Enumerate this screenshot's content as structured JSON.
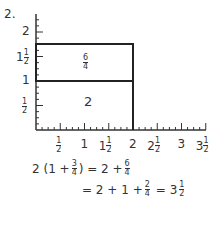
{
  "problem_number": "2.",
  "chart_data": {
    "type": "area",
    "title": "",
    "xlabel": "",
    "ylabel": "",
    "xlim": [
      0,
      3.5
    ],
    "ylim": [
      0,
      2
    ],
    "x_ticks": [
      "1/2",
      "1",
      "1 1/2",
      "2",
      "2 1/2",
      "3",
      "3 1/2"
    ],
    "y_ticks": [
      "1/2",
      "1",
      "1 1/2",
      "2"
    ],
    "rectangles": [
      {
        "x": [
          0,
          2
        ],
        "y": [
          0,
          1
        ],
        "label": "2"
      },
      {
        "x": [
          0,
          2
        ],
        "y": [
          1,
          1.75
        ],
        "label": "6/4"
      }
    ]
  },
  "labels": {
    "lower_region": "2",
    "upper_region_num": "6",
    "upper_region_den": "4"
  },
  "x_axis": [
    {
      "whole": "",
      "num": "1",
      "den": "2"
    },
    {
      "whole": "1",
      "num": "",
      "den": ""
    },
    {
      "whole": "1",
      "num": "1",
      "den": "2"
    },
    {
      "whole": "2",
      "num": "",
      "den": ""
    },
    {
      "whole": "2",
      "num": "1",
      "den": "2"
    },
    {
      "whole": "3",
      "num": "",
      "den": ""
    },
    {
      "whole": "3",
      "num": "1",
      "den": "2"
    }
  ],
  "y_axis": [
    {
      "whole": "",
      "num": "1",
      "den": "2"
    },
    {
      "whole": "1",
      "num": "",
      "den": ""
    },
    {
      "whole": "1",
      "num": "1",
      "den": "2"
    },
    {
      "whole": "2",
      "num": "",
      "den": ""
    }
  ],
  "equations": {
    "line1": {
      "left": "2 (1 +",
      "f1_num": "3",
      "f1_den": "4",
      "mid": ") = 2 +",
      "f2_num": "6",
      "f2_den": "4"
    },
    "line2": {
      "left": "= 2 + 1 +",
      "f1_num": "2",
      "f1_den": "4",
      "mid": "= 3",
      "f2_num": "1",
      "f2_den": "2"
    }
  }
}
